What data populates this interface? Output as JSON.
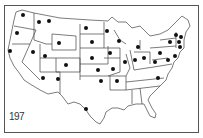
{
  "map": {
    "title": "",
    "subject": "United States map with marked state dots",
    "label": "197",
    "line_color": "#444444",
    "dot_color": "#111111",
    "dots": [
      {
        "state": "WA",
        "x": 23,
        "y": 15
      },
      {
        "state": "ID",
        "x": 39,
        "y": 22
      },
      {
        "state": "MT",
        "x": 49,
        "y": 21
      },
      {
        "state": "OR",
        "x": 17,
        "y": 33
      },
      {
        "state": "ND",
        "x": 86,
        "y": 28
      },
      {
        "state": "MN-north",
        "x": 107,
        "y": 31
      },
      {
        "state": "SD",
        "x": 92,
        "y": 42
      },
      {
        "state": "WY",
        "x": 59,
        "y": 43
      },
      {
        "state": "WI",
        "x": 119,
        "y": 41
      },
      {
        "state": "MI",
        "x": 138,
        "y": 47
      },
      {
        "state": "NY",
        "x": 170,
        "y": 42
      },
      {
        "state": "VT",
        "x": 176,
        "y": 35
      },
      {
        "state": "NH",
        "x": 181,
        "y": 37
      },
      {
        "state": "MA",
        "x": 179,
        "y": 42
      },
      {
        "state": "CT",
        "x": 180,
        "y": 47
      },
      {
        "state": "CA",
        "x": 10,
        "y": 51
      },
      {
        "state": "NV",
        "x": 33,
        "y": 52
      },
      {
        "state": "UT",
        "x": 45,
        "y": 56
      },
      {
        "state": "NE",
        "x": 92,
        "y": 58
      },
      {
        "state": "IA",
        "x": 110,
        "y": 53
      },
      {
        "state": "IL",
        "x": 125,
        "y": 62
      },
      {
        "state": "IN",
        "x": 135,
        "y": 60
      },
      {
        "state": "OH",
        "x": 144,
        "y": 58
      },
      {
        "state": "PA",
        "x": 160,
        "y": 53
      },
      {
        "state": "NJ",
        "x": 175,
        "y": 56
      },
      {
        "state": "MD",
        "x": 168,
        "y": 60
      },
      {
        "state": "WV",
        "x": 155,
        "y": 62
      },
      {
        "state": "CO",
        "x": 66,
        "y": 65
      },
      {
        "state": "KS",
        "x": 98,
        "y": 70
      },
      {
        "state": "MO",
        "x": 113,
        "y": 69
      },
      {
        "state": "AZ",
        "x": 43,
        "y": 78
      },
      {
        "state": "NM",
        "x": 58,
        "y": 79
      },
      {
        "state": "OK",
        "x": 101,
        "y": 81
      },
      {
        "state": "AR",
        "x": 117,
        "y": 81
      },
      {
        "state": "NC",
        "x": 158,
        "y": 78
      },
      {
        "state": "TX",
        "x": 86,
        "y": 109
      }
    ]
  }
}
